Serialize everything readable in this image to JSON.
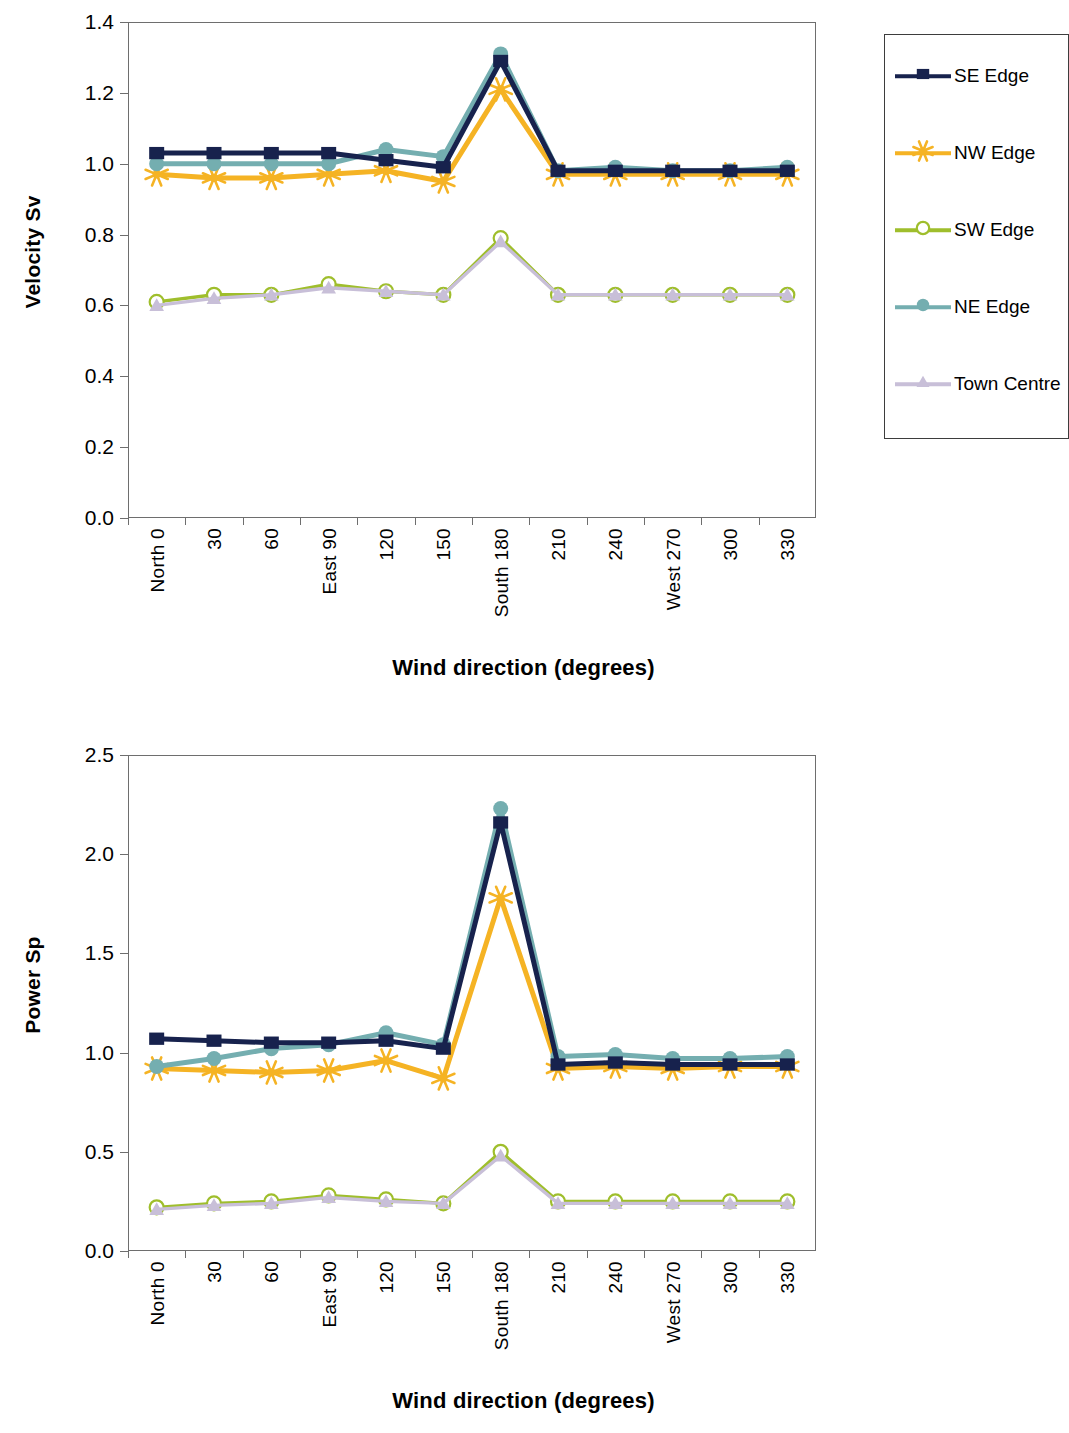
{
  "figure": {
    "background": "#ffffff"
  },
  "legend": {
    "position": "right",
    "items": [
      {
        "label": "SE Edge",
        "color": "#17224d",
        "marker": "square-marker"
      },
      {
        "label": "NW Edge",
        "color": "#f5b324",
        "marker": "star-marker"
      },
      {
        "label": "SW Edge",
        "color": "#9fbe2c",
        "marker": "open-circle-marker"
      },
      {
        "label": "NE Edge",
        "color": "#74aeb0",
        "marker": "circle-marker"
      },
      {
        "label": "Town Centre",
        "color": "#c8bfd8",
        "marker": "triangle-marker"
      }
    ]
  },
  "chart_data": [
    {
      "id": "velocity-chart",
      "type": "line",
      "title": "",
      "xlabel": "Wind direction (degrees)",
      "ylabel": "Velocity Sv",
      "categories": [
        "North 0",
        "30",
        "60",
        "East 90",
        "120",
        "150",
        "South 180",
        "210",
        "240",
        "West 270",
        "300",
        "330"
      ],
      "ylim": [
        0.0,
        1.4
      ],
      "yticks": [
        "0.0",
        "0.2",
        "0.4",
        "0.6",
        "0.8",
        "1.0",
        "1.2",
        "1.4"
      ],
      "grid": false,
      "legend": "right",
      "series": [
        {
          "name": "SE Edge",
          "color": "#17224d",
          "marker": "square-marker",
          "values": [
            1.03,
            1.03,
            1.03,
            1.03,
            1.01,
            0.99,
            1.29,
            0.98,
            0.98,
            0.98,
            0.98,
            0.98
          ]
        },
        {
          "name": "NW Edge",
          "color": "#f5b324",
          "marker": "star-marker",
          "values": [
            0.97,
            0.96,
            0.96,
            0.97,
            0.98,
            0.95,
            1.21,
            0.97,
            0.97,
            0.97,
            0.97,
            0.97
          ]
        },
        {
          "name": "SW Edge",
          "color": "#9fbe2c",
          "marker": "open-circle-marker",
          "values": [
            0.61,
            0.63,
            0.63,
            0.66,
            0.64,
            0.63,
            0.79,
            0.63,
            0.63,
            0.63,
            0.63,
            0.63
          ]
        },
        {
          "name": "NE Edge",
          "color": "#74aeb0",
          "marker": "circle-marker",
          "values": [
            1.0,
            1.0,
            1.0,
            1.0,
            1.04,
            1.02,
            1.31,
            0.98,
            0.99,
            0.98,
            0.98,
            0.99
          ]
        },
        {
          "name": "Town Centre",
          "color": "#c8bfd8",
          "marker": "triangle-marker",
          "values": [
            0.6,
            0.62,
            0.63,
            0.65,
            0.64,
            0.63,
            0.78,
            0.63,
            0.63,
            0.63,
            0.63,
            0.63
          ]
        }
      ]
    },
    {
      "id": "power-chart",
      "type": "line",
      "title": "",
      "xlabel": "Wind direction (degrees)",
      "ylabel": "Power Sp",
      "categories": [
        "North 0",
        "30",
        "60",
        "East 90",
        "120",
        "150",
        "South 180",
        "210",
        "240",
        "West 270",
        "300",
        "330"
      ],
      "ylim": [
        0.0,
        2.5
      ],
      "yticks": [
        "0.0",
        "0.5",
        "1.0",
        "1.5",
        "2.0",
        "2.5"
      ],
      "grid": false,
      "legend": "none",
      "series": [
        {
          "name": "SE Edge",
          "color": "#17224d",
          "marker": "square-marker",
          "values": [
            1.07,
            1.06,
            1.05,
            1.05,
            1.06,
            1.02,
            2.16,
            0.94,
            0.95,
            0.94,
            0.94,
            0.94
          ]
        },
        {
          "name": "NW Edge",
          "color": "#f5b324",
          "marker": "star-marker",
          "values": [
            0.92,
            0.91,
            0.9,
            0.91,
            0.96,
            0.87,
            1.78,
            0.92,
            0.93,
            0.92,
            0.93,
            0.93
          ]
        },
        {
          "name": "SW Edge",
          "color": "#9fbe2c",
          "marker": "open-circle-marker",
          "values": [
            0.22,
            0.24,
            0.25,
            0.28,
            0.26,
            0.24,
            0.5,
            0.25,
            0.25,
            0.25,
            0.25,
            0.25
          ]
        },
        {
          "name": "NE Edge",
          "color": "#74aeb0",
          "marker": "circle-marker",
          "values": [
            0.93,
            0.97,
            1.02,
            1.04,
            1.1,
            1.04,
            2.23,
            0.98,
            0.99,
            0.97,
            0.97,
            0.98
          ]
        },
        {
          "name": "Town Centre",
          "color": "#c8bfd8",
          "marker": "triangle-marker",
          "values": [
            0.21,
            0.23,
            0.24,
            0.27,
            0.25,
            0.24,
            0.48,
            0.24,
            0.24,
            0.24,
            0.24,
            0.24
          ]
        }
      ]
    }
  ]
}
